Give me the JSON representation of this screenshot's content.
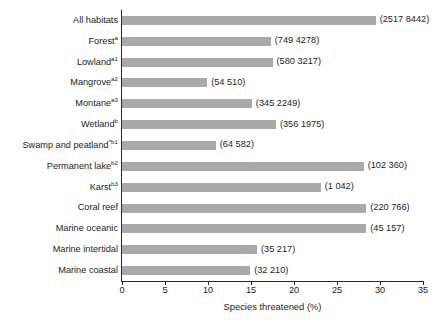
{
  "chart_data": {
    "type": "bar",
    "orientation": "horizontal",
    "title": "",
    "xlabel": "Species threatened (%)",
    "ylabel": "",
    "xlim": [
      0,
      35
    ],
    "xticks": [
      0,
      5,
      10,
      15,
      20,
      25,
      30,
      35
    ],
    "grid": false,
    "legend": null,
    "bar_color": "#a9a9a9",
    "axis_color": "#2b2b2b",
    "categories": [
      "All habitats",
      "Forest",
      "Lowland",
      "Mangrove",
      "Montane",
      "Wetland",
      "Swamp and peatland",
      "Permanent lake",
      "Karst",
      "Coral reef",
      "Marine oceanic",
      "Marine intertidal",
      "Marine coastal"
    ],
    "category_superscripts": [
      "",
      "a",
      "a1",
      "a2",
      "a3",
      "b",
      "*b1",
      "b2",
      "b3",
      "",
      "",
      "",
      ""
    ],
    "values": [
      29.5,
      17.3,
      17.5,
      9.9,
      15.1,
      17.9,
      10.9,
      28.1,
      23.1,
      28.4,
      28.4,
      15.7,
      14.9
    ],
    "point_labels": [
      "(2517 8442)",
      "(749 4278)",
      "(580 3217)",
      "(54 510)",
      "(345 2249)",
      "(356 1975)",
      "(64 582)",
      "(102 360)",
      "(1 042)",
      "(220 766)",
      "(45 157)",
      "(35 217)",
      "(32 210)"
    ]
  }
}
